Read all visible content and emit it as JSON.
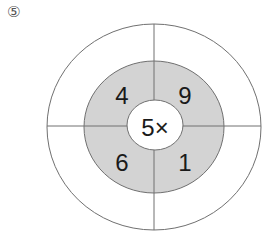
{
  "problem_label": "⑤",
  "center_text": "5×",
  "ring_numbers": {
    "top_left": "4",
    "top_right": "9",
    "bottom_left": "6",
    "bottom_right": "1"
  },
  "colors": {
    "ring_fill": "#d3d3d3",
    "stroke": "#707070",
    "background": "#ffffff"
  }
}
